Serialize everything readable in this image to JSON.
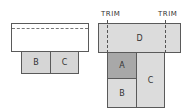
{
  "colors": {
    "white": "#ffffff",
    "light_gray": "#dcdcdc",
    "dark_gray": "#a8a8a8",
    "outline": "#5a5a5a"
  },
  "left": {
    "b_label": "B",
    "c_label": "C"
  },
  "right": {
    "trim_left": "TRIM",
    "trim_right": "TRIM",
    "d_label": "D",
    "a_label": "A",
    "b_label": "B",
    "c_label": "C"
  }
}
